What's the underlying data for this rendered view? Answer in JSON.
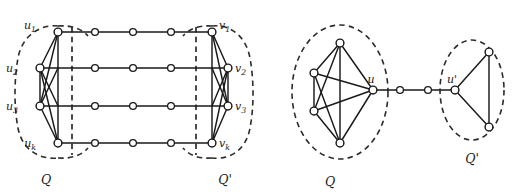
{
  "figure": {
    "colors": {
      "stroke": "#1a1a1a",
      "dash": "#2b2b2b",
      "node_fill": "#ffffff",
      "background": "#ffffff"
    },
    "left_diagram": {
      "cluster_left_label": "Q",
      "cluster_right_label": "Q'",
      "vertex_labels": {
        "u1": "u",
        "u1_sub": "1",
        "u2": "u",
        "u2_sub": "2",
        "u3": "u",
        "u3_sub": "3",
        "uk": "u",
        "uk_sub": "k",
        "v1": "v",
        "v1_sub": "1",
        "v2": "v",
        "v2_sub": "2",
        "v3": "v",
        "v3_sub": "3",
        "vk": "v",
        "vk_sub": "k"
      },
      "path_intermediate_node_count": 3,
      "row_count": 4
    },
    "right_diagram": {
      "cluster_left_label": "Q",
      "cluster_right_label": "Q'",
      "vertex_labels": {
        "u": "u",
        "u_prime": "u",
        "u_prime_mark": "'"
      },
      "left_cluster_size": 5,
      "right_cluster_size": 3,
      "path_intermediate_node_count": 2
    }
  }
}
